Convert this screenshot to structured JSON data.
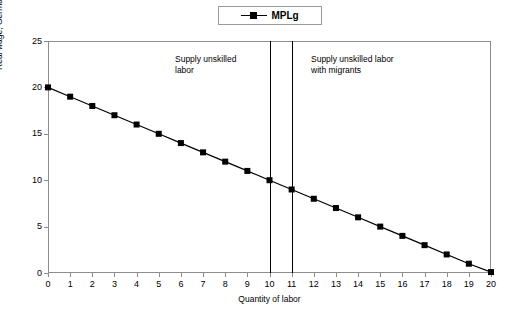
{
  "legend": {
    "label": "MPLg",
    "marker": "square-marker"
  },
  "annotations": [
    {
      "id": "supply-unskilled-labor",
      "text": "Supply unskilled\nlabor",
      "x": 10
    },
    {
      "id": "supply-unskilled-labor-with-migrants",
      "text": "Supply unskilled labor\nwith migrants",
      "x": 11
    }
  ],
  "chart_data": {
    "type": "line",
    "title": "",
    "xlabel": "Quantity of labor",
    "ylabel": "Real wage, Germany",
    "xlim": [
      0,
      20
    ],
    "ylim": [
      0,
      25
    ],
    "xticks": [
      0,
      1,
      2,
      3,
      4,
      5,
      6,
      7,
      8,
      9,
      10,
      11,
      12,
      13,
      14,
      15,
      16,
      17,
      18,
      19,
      20
    ],
    "yticks": [
      0,
      5,
      10,
      15,
      20,
      25
    ],
    "grid": false,
    "legend_position": "top-center",
    "series": [
      {
        "name": "MPLg",
        "color": "#000000",
        "marker": "square",
        "x": [
          0,
          1,
          2,
          3,
          4,
          5,
          6,
          7,
          8,
          9,
          10,
          11,
          12,
          13,
          14,
          15,
          16,
          17,
          18,
          19,
          20
        ],
        "values": [
          20,
          19,
          18,
          17,
          16,
          15,
          14,
          13,
          12,
          11,
          10,
          9,
          8,
          7,
          6,
          5,
          4,
          3,
          2,
          1,
          0.1
        ]
      }
    ],
    "vertical_lines": [
      {
        "name": "supply-unskilled-labor-line",
        "x": 10,
        "y_from": 25,
        "y_to": 0
      },
      {
        "name": "supply-unskilled-labor-with-migrants-line",
        "x": 11,
        "y_from": 25,
        "y_to": 0
      }
    ]
  }
}
